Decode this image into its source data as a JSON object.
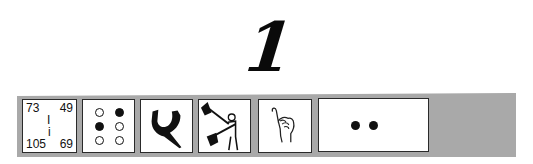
{
  "numeral": {
    "label": "1",
    "icon": "numeral-one"
  },
  "cells": [
    {
      "type": "number-codes",
      "top_left": "73",
      "top_right": "49",
      "middle_upper": "I",
      "middle_lower": "i",
      "bottom_left": "105",
      "bottom_right": "69"
    },
    {
      "type": "braille",
      "icon": "braille-cell-icon",
      "dots": [
        false,
        true,
        true,
        false,
        false,
        false
      ]
    },
    {
      "type": "hebrew-glyph",
      "icon": "hebrew-letter-icon"
    },
    {
      "type": "semaphore",
      "icon": "semaphore-flag-figure-icon"
    },
    {
      "type": "sign-language",
      "icon": "asl-hand-sign-icon"
    },
    {
      "type": "morse",
      "icon": "morse-code-icon",
      "symbols": "••"
    }
  ],
  "colors": {
    "strip": "#a9a9a9",
    "ink": "#111111",
    "cell_background": "#ffffff"
  }
}
